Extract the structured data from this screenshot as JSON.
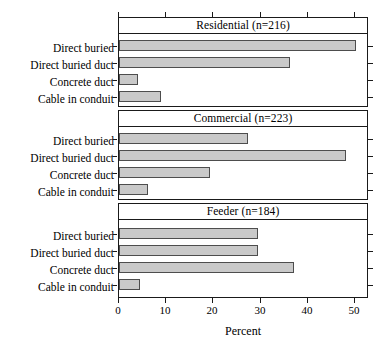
{
  "chart_data": {
    "type": "bar",
    "title": "",
    "subtitle": "",
    "orientation": "horizontal",
    "xlabel": "Percent",
    "ylabel": "",
    "xlim": [
      0,
      53
    ],
    "xticks": [
      0,
      10,
      20,
      30,
      40,
      50
    ],
    "xticklabels": [
      "0",
      "10",
      "20",
      "30",
      "40",
      "50"
    ],
    "grid": false,
    "legend": false,
    "bar_fill_color": "#c9c9c9",
    "bar_edge_color": "#4d4d4d",
    "frame_color": "#1a1a1a",
    "categories": [
      "Direct buried",
      "Direct buried duct",
      "Concrete duct",
      "Cable in conduit"
    ],
    "panels": [
      {
        "id": "residential",
        "strip_label": "Residential (n=216)",
        "name": "Residential",
        "n": 216,
        "values": [
          50.3,
          36.2,
          4.0,
          8.9
        ]
      },
      {
        "id": "commercial",
        "strip_label": "Commercial (n=223)",
        "name": "Commercial",
        "n": 223,
        "values": [
          27.3,
          48.1,
          19.3,
          6.2
        ]
      },
      {
        "id": "feeder",
        "strip_label": "Feeder (n=184)",
        "name": "Feeder",
        "n": 184,
        "values": [
          29.5,
          29.5,
          37.0,
          4.4
        ]
      }
    ]
  },
  "axis": {
    "x_title": "Percent",
    "tick_0": "0",
    "tick_10": "10",
    "tick_20": "20",
    "tick_30": "30",
    "tick_40": "40",
    "tick_50": "50"
  },
  "panel_strips": {
    "residential": "Residential (n=216)",
    "commercial": "Commercial (n=223)",
    "feeder": "Feeder (n=184)"
  },
  "category_labels": {
    "c0": "Direct buried",
    "c1": "Direct buried duct",
    "c2": "Concrete duct",
    "c3": "Cable in conduit"
  }
}
